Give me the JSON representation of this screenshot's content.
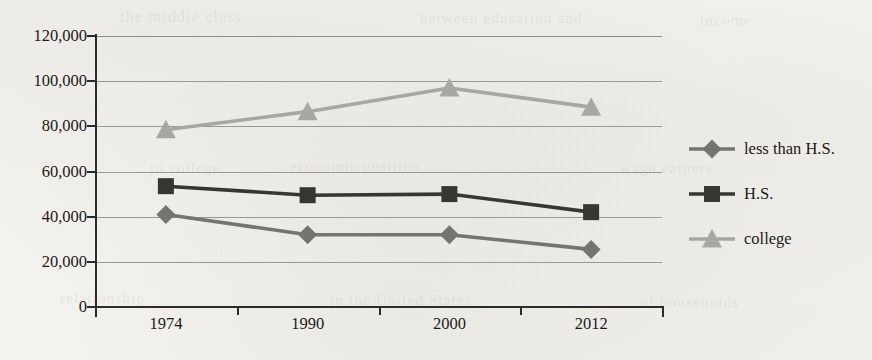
{
  "chart_data": {
    "type": "line",
    "title": "",
    "xlabel": "",
    "ylabel": "",
    "categories": [
      "1974",
      "1990",
      "2000",
      "2012"
    ],
    "ylim": [
      0,
      120000
    ],
    "ytick_values": [
      120000,
      100000,
      80000,
      60000,
      40000,
      20000,
      0
    ],
    "ytick_labels": [
      "120,000",
      "100,000",
      "80,000",
      "60,000",
      "40,000",
      "20,000",
      "0"
    ],
    "grid": true,
    "legend_position": "right",
    "series": [
      {
        "name": "less than H.S.",
        "marker": "diamond",
        "color": "#767471",
        "values": [
          41000,
          32000,
          32000,
          25500
        ]
      },
      {
        "name": "H.S.",
        "marker": "square",
        "color": "#383633",
        "values": [
          53500,
          49500,
          50000,
          42000
        ]
      },
      {
        "name": "college",
        "marker": "triangle",
        "color": "#a9a7a3",
        "values": [
          78500,
          86500,
          97000,
          88500
        ]
      }
    ]
  },
  "legend": {
    "items": [
      {
        "label": "less than H.S."
      },
      {
        "label": "H.S."
      },
      {
        "label": "college"
      }
    ]
  },
  "yaxis": {
    "labels": [
      "120,000",
      "100,000",
      "80,000",
      "60,000",
      "40,000",
      "20,000",
      "0"
    ]
  },
  "xaxis": {
    "labels": [
      "1974",
      "1990",
      "2000",
      "2012"
    ]
  },
  "background": {
    "page_color": "#f4f3ef",
    "ink_color": "#1c1a18",
    "grid_color": "#8d8a85"
  },
  "ghost_text": [
    {
      "text": "the middle class",
      "x": 120,
      "y": 8,
      "size": 16
    },
    {
      "text": "between education and",
      "x": 420,
      "y": 10,
      "size": 15
    },
    {
      "text": "income",
      "x": 700,
      "y": 12,
      "size": 15
    },
    {
      "text": "to college",
      "x": 150,
      "y": 160,
      "size": 15
    },
    {
      "text": "economic position",
      "x": 290,
      "y": 158,
      "size": 15
    },
    {
      "text": "wage earners",
      "x": 620,
      "y": 160,
      "size": 15
    },
    {
      "text": "relationship",
      "x": 60,
      "y": 290,
      "size": 15
    },
    {
      "text": "in the United States",
      "x": 330,
      "y": 292,
      "size": 15
    },
    {
      "text": "of households",
      "x": 640,
      "y": 294,
      "size": 15
    }
  ]
}
